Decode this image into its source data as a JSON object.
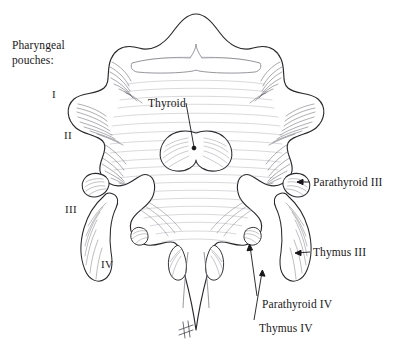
{
  "figure": {
    "domain_kind": "anatomical-line-illustration",
    "background_color": "#ffffff",
    "ink_color": "#19171a",
    "hatch_color": "#8d8d95",
    "width": 393,
    "height": 344,
    "caption": {
      "line1": "Pharyngeal",
      "line2": "pouches:"
    },
    "numerals": [
      {
        "id": "pouch-1",
        "text": "I",
        "x": 52,
        "y": 88
      },
      {
        "id": "pouch-2",
        "text": "II",
        "x": 64,
        "y": 129
      },
      {
        "id": "pouch-3",
        "text": "III",
        "x": 65,
        "y": 203
      },
      {
        "id": "pouch-4",
        "text": "IV",
        "x": 101,
        "y": 258
      }
    ],
    "labels": [
      {
        "id": "thyroid",
        "text": "Thyroid",
        "x": 148,
        "y": 97,
        "leader": {
          "type": "diagonal",
          "x1": 186,
          "y1": 107,
          "x2": 194,
          "y2": 146
        },
        "marker": "dot"
      },
      {
        "id": "parathyroid-3",
        "text": "Parathyroid III",
        "x": 313,
        "y": 176,
        "leader": {
          "type": "horizontal",
          "x1": 310,
          "y1": 182,
          "x2": 292,
          "y2": 182
        },
        "marker": "arrow-left"
      },
      {
        "id": "thymus-3",
        "text": "Thymus III",
        "x": 313,
        "y": 246,
        "leader": {
          "type": "horizontal",
          "x1": 310,
          "y1": 252,
          "x2": 289,
          "y2": 254
        },
        "marker": "arrow-left"
      },
      {
        "id": "parathyroid-4",
        "text": "Parathyroid IV",
        "x": 262,
        "y": 298,
        "leader": {
          "type": "vertical",
          "x1": 257,
          "y1": 296,
          "x2": 243,
          "y2": 243
        },
        "marker": "arrow-up"
      },
      {
        "id": "thymus-4",
        "text": "Thymus IV",
        "x": 259,
        "y": 322,
        "leader": {
          "type": "vertical",
          "x1": 254,
          "y1": 320,
          "x2": 267,
          "y2": 268
        },
        "marker": "arrow-up"
      }
    ]
  }
}
